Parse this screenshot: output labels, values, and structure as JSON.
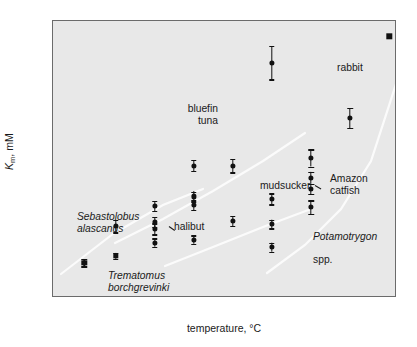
{
  "chart_data": {
    "type": "scatter",
    "title": "",
    "xlabel": "temperature, °C",
    "ylabel": "Km, mM",
    "ylabel_parts": {
      "symbol": "K",
      "subscript": "m",
      "units": ", mM"
    },
    "xlim": [
      -3,
      41
    ],
    "ylim": [
      0,
      0.9
    ],
    "xticks": [
      0,
      5,
      10,
      15,
      20,
      25,
      30,
      35,
      40
    ],
    "xtick_labels": [
      "0",
      "5",
      "10",
      "15",
      "20",
      "25",
      "30",
      "35",
      "40"
    ],
    "yticks": [
      0,
      0.1,
      0.2,
      0.3,
      0.4,
      0.5,
      0.6,
      0.7,
      0.8,
      0.9
    ],
    "ytick_labels": [
      "0",
      "0.1",
      "0.2",
      "0.3",
      "0.4",
      "0.5",
      "0.6",
      "0.7",
      "0.8",
      "0.9"
    ],
    "grid": false,
    "legend": "none",
    "plot_background": "#e8e8e8",
    "marker_color": "#111111",
    "curve_color": "#fbfbfb",
    "points": [
      {
        "x": 1,
        "y": 0.115,
        "err": 0.012,
        "marker": "square",
        "series": "Trematomus borchgrevinki"
      },
      {
        "x": 5,
        "y": 0.137,
        "err": 0.01,
        "marker": "square",
        "series": "Trematomus borchgrevinki"
      },
      {
        "x": 5,
        "y": 0.233,
        "err": 0.02,
        "marker": "circle",
        "series": "Sebastolobus alascanus"
      },
      {
        "x": 10,
        "y": 0.225,
        "err": 0.018,
        "marker": "circle",
        "series": "Sebastolobus alascanus"
      },
      {
        "x": 10,
        "y": 0.248,
        "err": 0.016,
        "marker": "circle",
        "series": "Sebastolobus alascanus"
      },
      {
        "x": 10,
        "y": 0.3,
        "err": 0.016,
        "marker": "circle",
        "series": "Sebastolobus alascanus"
      },
      {
        "x": 10,
        "y": 0.18,
        "err": 0.014,
        "marker": "circle",
        "series": "halibut"
      },
      {
        "x": 15,
        "y": 0.19,
        "err": 0.014,
        "marker": "circle",
        "series": "halibut"
      },
      {
        "x": 15,
        "y": 0.302,
        "err": 0.016,
        "marker": "circle",
        "series": "halibut"
      },
      {
        "x": 15,
        "y": 0.33,
        "err": 0.016,
        "marker": "circle",
        "series": "halibut"
      },
      {
        "x": 15,
        "y": 0.43,
        "err": 0.018,
        "marker": "circle",
        "series": "bluefin tuna"
      },
      {
        "x": 20,
        "y": 0.43,
        "err": 0.022,
        "marker": "circle",
        "series": "bluefin tuna"
      },
      {
        "x": 20,
        "y": 0.25,
        "err": 0.016,
        "marker": "circle",
        "series": "mudsucker"
      },
      {
        "x": 25,
        "y": 0.765,
        "err": 0.055,
        "marker": "circle",
        "series": "bluefin tuna"
      },
      {
        "x": 25,
        "y": 0.322,
        "err": 0.018,
        "marker": "circle",
        "series": "mudsucker"
      },
      {
        "x": 25,
        "y": 0.24,
        "err": 0.014,
        "marker": "circle",
        "series": "mudsucker"
      },
      {
        "x": 25,
        "y": 0.165,
        "err": 0.014,
        "marker": "circle",
        "series": "Potamotrygon spp."
      },
      {
        "x": 30,
        "y": 0.455,
        "err": 0.028,
        "marker": "circle",
        "series": "Amazon catfish"
      },
      {
        "x": 30,
        "y": 0.39,
        "err": 0.02,
        "marker": "circle",
        "series": "Amazon catfish"
      },
      {
        "x": 30,
        "y": 0.355,
        "err": 0.016,
        "marker": "circle",
        "series": "Amazon catfish"
      },
      {
        "x": 30,
        "y": 0.295,
        "err": 0.022,
        "marker": "circle",
        "series": "Potamotrygon spp."
      },
      {
        "x": 35,
        "y": 0.585,
        "err": 0.032,
        "marker": "circle",
        "series": "rabbit"
      },
      {
        "x": 40,
        "y": 0.85,
        "err": 0.0,
        "marker": "square",
        "series": "rabbit"
      }
    ],
    "curves": [
      {
        "name": "low-temperature species",
        "path": "M 8 253 L 60 213 L 110 184 L 150 168"
      },
      {
        "name": "mid-temperature species",
        "path": "M 62 222 L 110 198 L 160 170 L 210 140 L 252 112"
      },
      {
        "name": "warm-water species",
        "path": "M 112 245 L 160 226 L 210 206 L 258 188"
      },
      {
        "name": "tropical / homeotherm",
        "path": "M 214 252 L 252 224 L 288 188 L 318 140 L 344 60"
      }
    ],
    "annotations": [
      {
        "id": "trematomus",
        "text": "Trematomus\nborchgrevinki",
        "style": "italic"
      },
      {
        "id": "sebastolobus",
        "text": "Sebastolobus\nalascanus",
        "style": "italic"
      },
      {
        "id": "halibut",
        "text": "halibut",
        "style": "plain"
      },
      {
        "id": "bluefin",
        "text": "bluefin\ntuna",
        "style": "plain"
      },
      {
        "id": "mudsucker",
        "text": "mudsucker",
        "style": "plain"
      },
      {
        "id": "amazon",
        "text": "Amazon\ncatfish",
        "style": "plain"
      },
      {
        "id": "potamotrygon",
        "text": "Potamotrygon\nspp.",
        "style": "italic-partial"
      },
      {
        "id": "potamotrygon_line1",
        "text": "Potamotrygon",
        "style": "italic"
      },
      {
        "id": "potamotrygon_line2",
        "text": "spp.",
        "style": "plain"
      },
      {
        "id": "rabbit",
        "text": "rabbit",
        "style": "plain"
      }
    ]
  }
}
